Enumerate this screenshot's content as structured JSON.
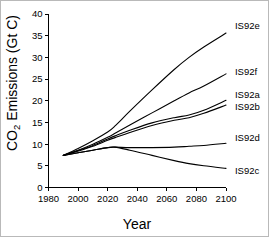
{
  "chart_data": {
    "type": "line",
    "title": "",
    "xlabel": "Year",
    "ylabel": "CO2 Emissions (Gt C)",
    "ylabel_prefix": "CO",
    "ylabel_subscript": "2",
    "ylabel_suffix": " Emissions (Gt C)",
    "xlim": [
      1980,
      2100
    ],
    "ylim": [
      0,
      40
    ],
    "xticks": [
      1980,
      2000,
      2020,
      2040,
      2060,
      2080,
      2100
    ],
    "xtick_labels": [
      "1980",
      "2000",
      "2020",
      "2040",
      "2060",
      "2080",
      "2100"
    ],
    "yticks": [
      0,
      5,
      10,
      15,
      20,
      25,
      30,
      35,
      40
    ],
    "ytick_labels": [
      "0",
      "5",
      "10",
      "15",
      "20",
      "25",
      "30",
      "35",
      "40"
    ],
    "grid": false,
    "legend_position": "right-inline-labels",
    "x": [
      1990,
      2000,
      2010,
      2020,
      2025,
      2035,
      2050,
      2065,
      2075,
      2085,
      2100
    ],
    "series": [
      {
        "name": "IS92e",
        "label": "IS92e",
        "color": "#000000",
        "values": [
          7.4,
          9.0,
          10.8,
          12.8,
          14.2,
          17.6,
          22.5,
          27.2,
          30.0,
          32.4,
          35.6
        ],
        "label_x": 2104,
        "label_y": 36.5
      },
      {
        "name": "IS92f",
        "label": "IS92f",
        "color": "#000000",
        "values": [
          7.4,
          8.6,
          10.0,
          11.6,
          12.5,
          14.4,
          17.2,
          20.0,
          21.8,
          23.4,
          26.2
        ],
        "label_x": 2104,
        "label_y": 25.9
      },
      {
        "name": "IS92a",
        "label": "IS92a",
        "color": "#000000",
        "values": [
          7.4,
          8.5,
          9.7,
          11.2,
          11.9,
          13.2,
          14.9,
          16.1,
          16.7,
          17.8,
          20.1
        ],
        "label_x": 2104,
        "label_y": 20.6
      },
      {
        "name": "IS92b",
        "label": "IS92b",
        "color": "#000000",
        "values": [
          7.4,
          8.4,
          9.5,
          10.9,
          11.5,
          12.7,
          14.3,
          15.5,
          16.1,
          17.1,
          19.0
        ],
        "label_x": 2104,
        "label_y": 17.8
      },
      {
        "name": "IS92d",
        "label": "IS92d",
        "color": "#000000",
        "values": [
          7.4,
          8.0,
          8.6,
          9.2,
          9.3,
          9.2,
          9.2,
          9.3,
          9.5,
          9.7,
          10.2
        ],
        "label_x": 2104,
        "label_y": 10.8
      },
      {
        "name": "IS92c",
        "label": "IS92c",
        "color": "#000000",
        "values": [
          7.4,
          8.0,
          8.6,
          9.2,
          9.3,
          8.6,
          7.4,
          6.2,
          5.5,
          5.0,
          4.4
        ],
        "label_x": 2104,
        "label_y": 3.2
      }
    ]
  }
}
